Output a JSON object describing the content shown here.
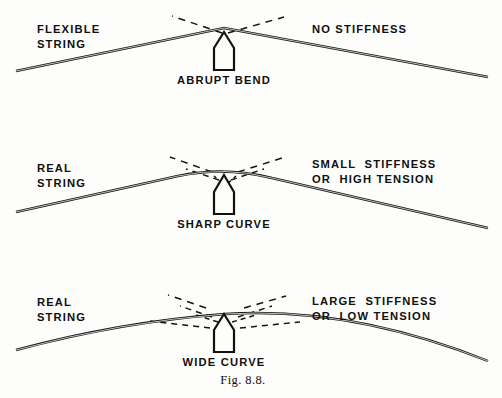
{
  "figure": {
    "caption": "Fig. 8.8.",
    "ink_color": "#141414",
    "background_color": "#fdfdfb"
  },
  "panels": [
    {
      "id": "flexible-string",
      "left_label_line1": "FLEXIBLE",
      "left_label_line2": "STRING",
      "right_label_line1": "NO STIFFNESS",
      "right_label_line2": "",
      "callout_label": "ABRUPT BEND",
      "peak_kind": "sharp-vertex"
    },
    {
      "id": "real-string-high-tension",
      "left_label_line1": "REAL",
      "left_label_line2": "STRING",
      "right_label_line1": "SMALL  STIFFNESS",
      "right_label_line2": "OR  HIGH TENSION",
      "callout_label": "SHARP CURVE",
      "peak_kind": "small-radius-arc"
    },
    {
      "id": "real-string-low-tension",
      "left_label_line1": "REAL",
      "left_label_line2": "STRING",
      "right_label_line1": "LARGE  STIFFNESS",
      "right_label_line2": "OR  LOW TENSION",
      "callout_label": "WIDE CURVE",
      "peak_kind": "wide-radius-arc"
    }
  ]
}
